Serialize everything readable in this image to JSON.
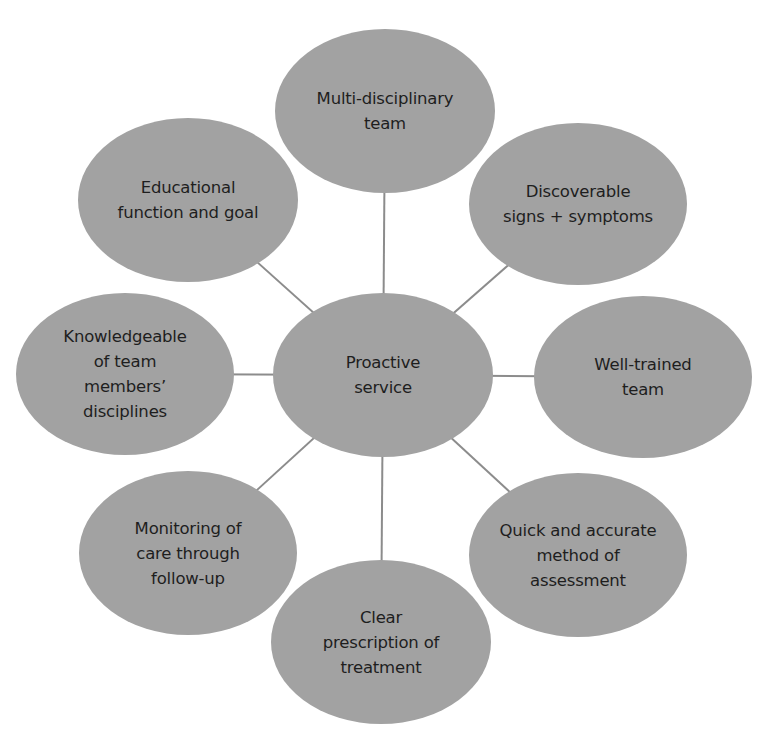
{
  "diagram": {
    "type": "hub-and-spoke",
    "colors": {
      "node_fill": "#a2a2a2",
      "connector": "#8c8c8c",
      "text": "#1e1e1e",
      "background": "#ffffff"
    },
    "center": {
      "id": "proactive-service",
      "lines": [
        "Proactive",
        "service"
      ],
      "cx": 383,
      "cy": 375,
      "rx": 110,
      "ry": 82
    },
    "nodes": [
      {
        "id": "multi-disciplinary-team",
        "lines": [
          "Multi-disciplinary",
          "team"
        ],
        "cx": 385,
        "cy": 111,
        "rx": 110,
        "ry": 82
      },
      {
        "id": "discoverable-signs-symptoms",
        "lines": [
          "Discoverable",
          "signs + symptoms"
        ],
        "cx": 578,
        "cy": 204,
        "rx": 109,
        "ry": 81
      },
      {
        "id": "well-trained-team",
        "lines": [
          "Well-trained",
          "team"
        ],
        "cx": 643,
        "cy": 377,
        "rx": 109,
        "ry": 81
      },
      {
        "id": "quick-accurate-assessment",
        "lines": [
          "Quick and accurate",
          "method of",
          "assessment"
        ],
        "cx": 578,
        "cy": 555,
        "rx": 109,
        "ry": 82
      },
      {
        "id": "clear-prescription-treatment",
        "lines": [
          "Clear",
          "prescription of",
          "treatment"
        ],
        "cx": 381,
        "cy": 642,
        "rx": 110,
        "ry": 82
      },
      {
        "id": "monitoring-care-follow-up",
        "lines": [
          "Monitoring of",
          "care through",
          "follow-up"
        ],
        "cx": 188,
        "cy": 553,
        "rx": 109,
        "ry": 82
      },
      {
        "id": "knowledgeable-team-disciplines",
        "lines": [
          "Knowledgeable",
          "of team",
          "members’",
          "disciplines"
        ],
        "cx": 125,
        "cy": 374,
        "rx": 109,
        "ry": 81
      },
      {
        "id": "educational-function-goal",
        "lines": [
          "Educational",
          "function and goal"
        ],
        "cx": 188,
        "cy": 200,
        "rx": 110,
        "ry": 82
      }
    ]
  }
}
